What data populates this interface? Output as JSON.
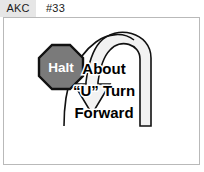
{
  "header": {
    "organization": "AKC",
    "exercise_number": "#33"
  },
  "diagram": {
    "title": "About “U” Turn Forward",
    "halt_sign": {
      "label": "Halt",
      "shape": "octagon",
      "fill_color": "#7a7a7a",
      "border_color": "#111111",
      "text_color": "#ffffff"
    },
    "instruction_lines": [
      "About",
      "“U” Turn",
      "Forward"
    ],
    "arrow": {
      "name": "u-turn-arrow",
      "direction": "u-turn-forward",
      "fill_color": "#f2f2f2",
      "stroke_color": "#111111",
      "arrowhead": "down"
    },
    "frame_color": "#b9b9b9",
    "background_color": "#ffffff"
  }
}
